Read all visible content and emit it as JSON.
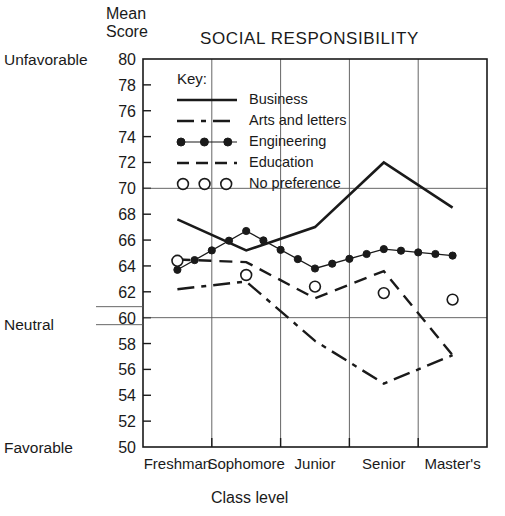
{
  "chart_data": {
    "type": "line",
    "title": "SOCIAL RESPONSIBILITY",
    "xlabel": "Class level",
    "ylabel": "Mean Score",
    "ylabel_line1": "Mean",
    "ylabel_line2": "Score",
    "categories": [
      "Freshman",
      "Sophomore",
      "Junior",
      "Senior",
      "Master's"
    ],
    "ylim": [
      50,
      80
    ],
    "ytick_step": 2,
    "yticks": [
      50,
      52,
      54,
      56,
      58,
      60,
      62,
      64,
      66,
      68,
      70,
      72,
      74,
      76,
      78,
      80
    ],
    "grid": "horizontal gridlines at 70 and 60; vertical gridlines at each class level",
    "gridline_values": [
      70,
      60
    ],
    "anchor_labels": [
      {
        "text": "Unfavorable",
        "value": 80
      },
      {
        "text": "Neutral",
        "value": 60
      },
      {
        "text": "Favorable",
        "value": 50
      }
    ],
    "legend_title": "Key:",
    "legend_position": "inside upper-left",
    "series": [
      {
        "name": "Business",
        "style": "solid",
        "marker": "none",
        "values": [
          67.6,
          65.2,
          67.0,
          72.0,
          68.5
        ]
      },
      {
        "name": "Arts and letters",
        "style": "dash-dot",
        "marker": "none",
        "values": [
          62.2,
          62.8,
          58.2,
          54.9,
          57.1
        ]
      },
      {
        "name": "Engineering",
        "style": "solid-with-dots",
        "marker": "filled-circle",
        "values": [
          63.7,
          66.7,
          63.8,
          65.3,
          64.8
        ]
      },
      {
        "name": "Education",
        "style": "dashed",
        "marker": "none",
        "values": [
          64.5,
          64.3,
          61.5,
          63.6,
          57.1
        ]
      },
      {
        "name": "No preference",
        "style": "markers-only",
        "marker": "open-circle",
        "values": [
          64.4,
          63.3,
          62.4,
          61.9,
          61.4
        ]
      }
    ]
  },
  "legend": {
    "title": "Key:",
    "items": [
      {
        "label": "Business",
        "swatch": "solid-line"
      },
      {
        "label": "Arts and letters",
        "swatch": "dash-dot-line"
      },
      {
        "label": "Engineering",
        "swatch": "dotted-marker-line"
      },
      {
        "label": "Education",
        "swatch": "dashed-line"
      },
      {
        "label": "No preference",
        "swatch": "open-circle-markers"
      }
    ]
  },
  "colors": {
    "ink": "#1a1a1a",
    "grid": "#555555",
    "background": "#ffffff"
  }
}
